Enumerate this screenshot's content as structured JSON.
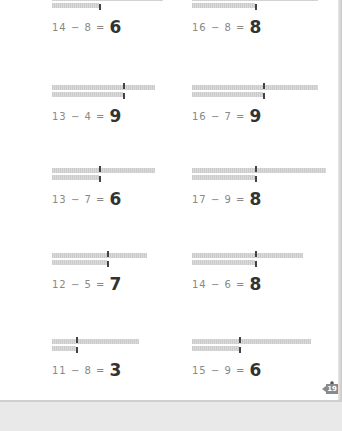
{
  "worksheet": {
    "unit_px": 7.9,
    "problems": [
      {
        "id": "p1",
        "minuend": 14,
        "subtrahend": 8,
        "answer": "6",
        "text": "14 − 8 =",
        "x": 52,
        "y": -4
      },
      {
        "id": "p2",
        "minuend": 16,
        "subtrahend": 8,
        "answer": "8",
        "text": "16 − 8 =",
        "x": 192,
        "y": -4
      },
      {
        "id": "p3",
        "minuend": 13,
        "subtrahend": 4,
        "answer": "9",
        "text": "13 − 4 =",
        "x": 52,
        "y": 85
      },
      {
        "id": "p4",
        "minuend": 16,
        "subtrahend": 7,
        "answer": "9",
        "text": "16 − 7 =",
        "x": 192,
        "y": 85
      },
      {
        "id": "p5",
        "minuend": 13,
        "subtrahend": 7,
        "answer": "6",
        "text": "13 − 7 =",
        "x": 52,
        "y": 168
      },
      {
        "id": "p6",
        "minuend": 17,
        "subtrahend": 9,
        "answer": "8",
        "text": "17 − 9 =",
        "x": 192,
        "y": 168
      },
      {
        "id": "p7",
        "minuend": 12,
        "subtrahend": 5,
        "answer": "7",
        "text": "12 − 5 =",
        "x": 52,
        "y": 253
      },
      {
        "id": "p8",
        "minuend": 14,
        "subtrahend": 6,
        "answer": "8",
        "text": "14 − 6 =",
        "x": 192,
        "y": 253
      },
      {
        "id": "p9",
        "minuend": 11,
        "subtrahend": 8,
        "answer": "3",
        "text": "11 − 8 =",
        "x": 52,
        "y": 339
      },
      {
        "id": "p10",
        "minuend": 15,
        "subtrahend": 9,
        "answer": "6",
        "text": "15 − 9 =",
        "x": 192,
        "y": 339
      }
    ]
  },
  "footer": {
    "page_number": "19",
    "mascot_icon": "cartoon-character-icon"
  },
  "colors": {
    "bar": "#d2d2d2",
    "divider": "#444444",
    "answer": "#333333",
    "equation": "#888888",
    "badge": "#8a8a8a"
  }
}
